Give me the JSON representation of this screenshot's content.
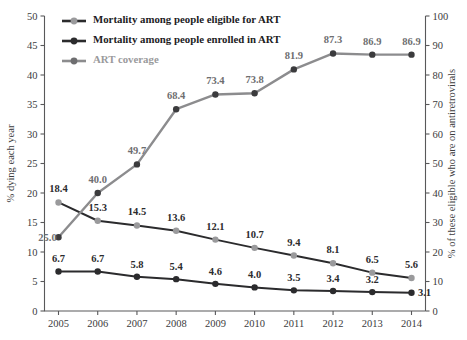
{
  "chart_data": {
    "type": "line",
    "title": "",
    "x": [
      2005,
      2006,
      2007,
      2008,
      2009,
      2010,
      2011,
      2012,
      2013,
      2014
    ],
    "categories": [
      "2005",
      "2006",
      "2007",
      "2008",
      "2009",
      "2010",
      "2011",
      "2012",
      "2013",
      "2014"
    ],
    "xlabel": "",
    "ylabel": "% dying each year",
    "y2label": "% of these eligible who are on antiretrovirals",
    "ylim": [
      0,
      50
    ],
    "y2lim": [
      0,
      100
    ],
    "yticks": [
      "0",
      "5",
      "10",
      "15",
      "20",
      "25",
      "30",
      "35",
      "40",
      "45",
      "50"
    ],
    "ytick_values": [
      0,
      5,
      10,
      15,
      20,
      25,
      30,
      35,
      40,
      45,
      50
    ],
    "y2ticks": [
      "0",
      "10",
      "20",
      "30",
      "40",
      "50",
      "60",
      "70",
      "80",
      "90",
      "100"
    ],
    "y2tick_values": [
      0,
      10,
      20,
      30,
      40,
      50,
      60,
      70,
      80,
      90,
      100
    ],
    "grid": false,
    "legend_position": "top-left",
    "series": [
      {
        "name": "Mortality among people eligible for ART",
        "axis": "left",
        "line_color": "#2b2b2d",
        "marker_color": "#9a9a9c",
        "values": [
          18.4,
          15.3,
          14.5,
          13.6,
          12.1,
          10.7,
          9.4,
          8.1,
          6.5,
          5.6
        ],
        "labels": [
          "18.4",
          "15.3",
          "14.5",
          "13.6",
          "12.1",
          "10.7",
          "9.4",
          "8.1",
          "6.5",
          "5.6"
        ],
        "label_color": "#2b2b2d"
      },
      {
        "name": "Mortality among people enrolled in ART",
        "axis": "left",
        "line_color": "#2b2b2d",
        "marker_color": "#2b2b2d",
        "values": [
          6.7,
          6.7,
          5.8,
          5.4,
          4.6,
          4.0,
          3.5,
          3.4,
          3.2,
          3.1
        ],
        "labels": [
          "6.7",
          "6.7",
          "5.8",
          "5.4",
          "4.6",
          "4.0",
          "3.5",
          "3.4",
          "3.2",
          "3.1"
        ],
        "label_color": "#2b2b2d"
      },
      {
        "name": "ART coverage",
        "axis": "right",
        "line_color": "#8c8c8e",
        "marker_color": "#3b3b3d",
        "values": [
          25.0,
          40.0,
          49.7,
          68.4,
          73.4,
          73.8,
          81.9,
          87.3,
          86.9,
          86.9
        ],
        "labels": [
          "25.0",
          "40.0",
          "49.7",
          "68.4",
          "73.4",
          "73.8",
          "81.9",
          "87.3",
          "86.9",
          "86.9"
        ],
        "label_color": "#6e6e70"
      }
    ]
  },
  "legend": {
    "items": [
      {
        "label": "Mortality among people eligible for ART",
        "line_color": "#2b2b2d",
        "marker_color": "#9a9a9c",
        "text_color": "#1c1c1e"
      },
      {
        "label": "Mortality among people enrolled in ART",
        "line_color": "#2b2b2d",
        "marker_color": "#2b2b2d",
        "text_color": "#1c1c1e"
      },
      {
        "label": "ART coverage",
        "line_color": "#8c8c8e",
        "marker_color": "#6e6e70",
        "text_color": "#9a9a9c"
      }
    ]
  },
  "axes": {
    "left_title": "% dying each year",
    "right_title": "% of these eligible who are on antiretrovirals"
  },
  "colors": {
    "axis": "#58585a",
    "dark_series": "#2b2b2d",
    "gray_series": "#8c8c8e",
    "gray_marker": "#9a9a9c",
    "background": "#ffffff"
  }
}
